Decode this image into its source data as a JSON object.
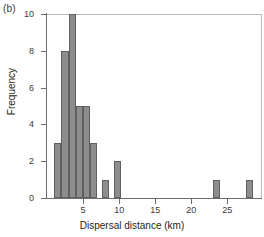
{
  "panel": {
    "label": "(b)"
  },
  "chart_data": {
    "type": "bar",
    "title": "",
    "subtitle": "",
    "panel_label": "(b)",
    "xlabel": "Dispersal distance (km)",
    "ylabel": "Frequency",
    "xlim": [
      0,
      29.8
    ],
    "ylim": [
      0,
      10
    ],
    "xticks": [
      5,
      10,
      15,
      20,
      25
    ],
    "yticks": [
      0,
      2,
      4,
      6,
      8,
      10
    ],
    "grid": false,
    "legend": null,
    "bar_fill_color": "#8d8d8d",
    "bar_edge_color": "#5f5f5f",
    "axis_color": "#6d6d6d",
    "bin_width": 1,
    "bins": [
      {
        "x_start": 1,
        "x_end": 2,
        "value": 3
      },
      {
        "x_start": 2,
        "x_end": 3,
        "value": 8
      },
      {
        "x_start": 3,
        "x_end": 4,
        "value": 10
      },
      {
        "x_start": 4,
        "x_end": 5,
        "value": 5
      },
      {
        "x_start": 5,
        "x_end": 6,
        "value": 5
      },
      {
        "x_start": 6,
        "x_end": 7,
        "value": 3
      },
      {
        "x_start": 7.6,
        "x_end": 8.6,
        "value": 1
      },
      {
        "x_start": 9.3,
        "x_end": 10.3,
        "value": 2
      },
      {
        "x_start": 23.0,
        "x_end": 24.0,
        "value": 1
      },
      {
        "x_start": 27.6,
        "x_end": 28.6,
        "value": 1
      }
    ],
    "categories": [
      "1-2",
      "2-3",
      "3-4",
      "4-5",
      "5-6",
      "6-7",
      "7.6-8.6",
      "9.3-10.3",
      "23-24",
      "27.6-28.6"
    ],
    "values": [
      3,
      8,
      10,
      5,
      5,
      3,
      1,
      2,
      1,
      1
    ]
  }
}
